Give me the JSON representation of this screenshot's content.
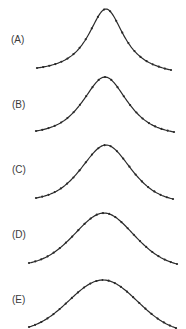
{
  "chart_data": [
    {
      "type": "line",
      "label": "(A)",
      "shape": "lorentzian",
      "x_start": 37,
      "x_peak": 106,
      "x_end": 171,
      "y_base_left": 68,
      "y_base_right": 70,
      "y_peak": 9,
      "width": 22,
      "markers": 22,
      "label_y": 43,
      "grid": false,
      "axes": false
    },
    {
      "type": "line",
      "label": "(B)",
      "shape": "lorentzian-gaussian-mix",
      "x_start": 36,
      "x_peak": 105,
      "x_end": 174,
      "y_base_left": 131,
      "y_base_right": 132,
      "y_peak": 77,
      "width": 27,
      "markers": 22,
      "label_y": 108,
      "grid": false,
      "axes": false
    },
    {
      "type": "line",
      "label": "(C)",
      "shape": "lorentzian-gaussian-mix",
      "x_start": 36,
      "x_peak": 106,
      "x_end": 173,
      "y_base_left": 198,
      "y_base_right": 199,
      "y_peak": 145,
      "width": 30,
      "markers": 22,
      "label_y": 173,
      "grid": false,
      "axes": false
    },
    {
      "type": "line",
      "label": "(D)",
      "shape": "gaussian-like",
      "x_start": 29,
      "x_peak": 104,
      "x_end": 177,
      "y_base_left": 263,
      "y_base_right": 264,
      "y_peak": 213,
      "width": 36,
      "markers": 24,
      "label_y": 238,
      "grid": false,
      "axes": false
    },
    {
      "type": "line",
      "label": "(E)",
      "shape": "gaussian",
      "x_start": 29,
      "x_peak": 103,
      "x_end": 176,
      "y_base_left": 327,
      "y_base_right": 328,
      "y_peak": 280,
      "width": 40,
      "markers": 24,
      "label_y": 303,
      "grid": false,
      "axes": false
    }
  ],
  "panels": {
    "a": {
      "label": "(A)"
    },
    "b": {
      "label": "(B)"
    },
    "c": {
      "label": "(C)"
    },
    "d": {
      "label": "(D)"
    },
    "e": {
      "label": "(E)"
    }
  }
}
